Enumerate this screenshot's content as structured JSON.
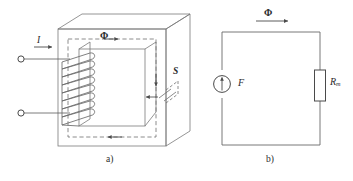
{
  "figure": {
    "stroke_color": "#7a7a7a",
    "dark_stroke_color": "#4a4a4a",
    "text_color": "#2b2b2b",
    "background": "#ffffff"
  },
  "part_a": {
    "caption": "a)",
    "flux_label": "Φ",
    "current_label": "I",
    "area_label": "S",
    "coil_turns": 8,
    "description": "Iron core with winding"
  },
  "part_b": {
    "caption": "b)",
    "flux_label": "Φ",
    "source_label": "F",
    "resistor_label_main": "R",
    "resistor_label_sub": "m",
    "description": "Equivalent magnetic circuit"
  }
}
